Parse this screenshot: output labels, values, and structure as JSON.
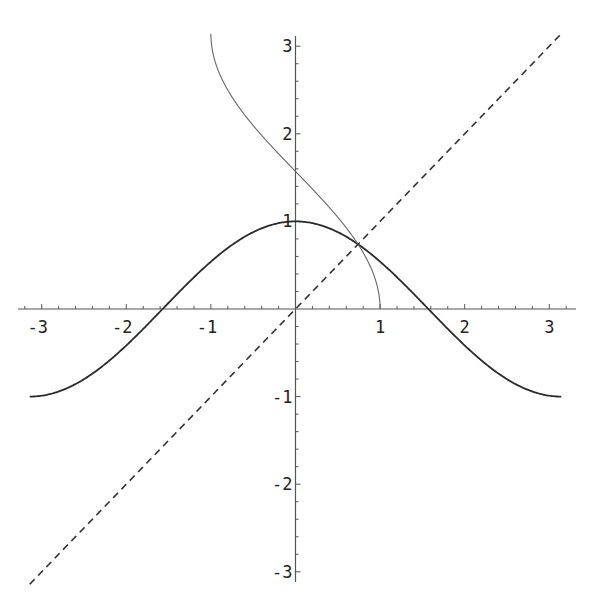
{
  "chart_data": {
    "type": "line",
    "title": "",
    "xlabel": "",
    "ylabel": "",
    "xlim": [
      -3.14159,
      3.14159
    ],
    "ylim": [
      -3.14159,
      3.14159
    ],
    "grid": false,
    "legend": null,
    "x_ticks": [
      -3,
      -2,
      -1,
      1,
      2,
      3
    ],
    "y_ticks": [
      -3,
      -2,
      -1,
      1,
      2,
      3
    ],
    "x_tick_labels": [
      "-3",
      "-2",
      "-1",
      "1",
      "2",
      "3"
    ],
    "y_tick_labels": [
      "-3",
      "-2",
      "-1",
      "1",
      "2",
      "3"
    ],
    "series": [
      {
        "name": "cos(x)",
        "domain": [
          -3.14159,
          3.14159
        ],
        "style": "solid",
        "color": "#2a2a2a",
        "width": 1.8
      },
      {
        "name": "arccos(x)",
        "domain": [
          -1,
          1
        ],
        "style": "solid",
        "color": "#666666",
        "width": 1.1
      },
      {
        "name": "y = x",
        "domain": [
          -3.14159,
          3.14159
        ],
        "style": "dashed",
        "color": "#333333",
        "width": 1.6
      }
    ],
    "annotations": [
      "cos(x) and arccos(x) intersect y=x at approx (0.739, 0.739)"
    ]
  },
  "colors": {
    "axis": "#555555",
    "background": "#ffffff"
  }
}
